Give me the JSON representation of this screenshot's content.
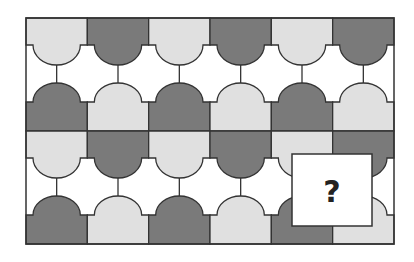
{
  "puzzle": {
    "type": "pattern-completion",
    "columns": 6,
    "blocks": 2,
    "colors": {
      "light": "#e0e0e0",
      "dark": "#7a7a7a",
      "white": "#ffffff",
      "stroke": "#333333"
    },
    "grid": [
      {
        "top_band": [
          "light",
          "dark",
          "light",
          "dark",
          "light",
          "dark"
        ],
        "bottom_band": [
          "dark",
          "light",
          "dark",
          "light",
          "dark",
          "light"
        ]
      },
      {
        "top_band": [
          "light",
          "dark",
          "light",
          "dark",
          "light",
          "dark"
        ],
        "bottom_band": [
          "dark",
          "light",
          "dark",
          "light",
          "dark",
          "light"
        ]
      }
    ],
    "missing_piece": {
      "label": "?"
    }
  }
}
